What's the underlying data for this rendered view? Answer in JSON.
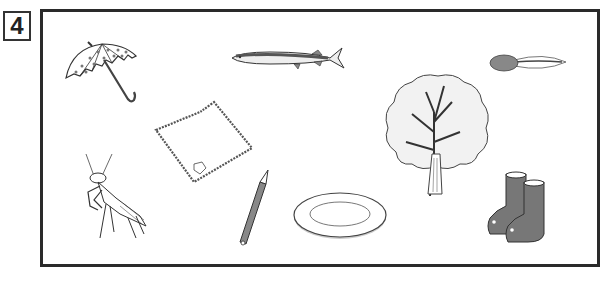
{
  "question": {
    "number": "4"
  },
  "items": [
    {
      "id": "umbrella",
      "label": "umbrella"
    },
    {
      "id": "saury-fish",
      "label": "saury fish"
    },
    {
      "id": "tadpole",
      "label": "tadpole"
    },
    {
      "id": "handkerchief",
      "label": "handkerchief"
    },
    {
      "id": "tree",
      "label": "tree"
    },
    {
      "id": "praying-mantis",
      "label": "praying mantis"
    },
    {
      "id": "pencil",
      "label": "pencil"
    },
    {
      "id": "plate",
      "label": "plate"
    },
    {
      "id": "rain-boots",
      "label": "rain boots"
    }
  ],
  "colors": {
    "frame": "#2a2a2a",
    "line": "#333333",
    "fill_gray": "#777777",
    "fill_light": "#eeeeee"
  }
}
